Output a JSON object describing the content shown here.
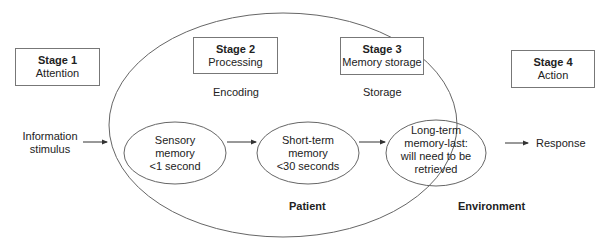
{
  "stages": [
    {
      "title": "Stage 1",
      "subtitle": "Attention"
    },
    {
      "title": "Stage 2",
      "subtitle": "Processing"
    },
    {
      "title": "Stage 3",
      "subtitle": "Memory storage"
    },
    {
      "title": "Stage 4",
      "subtitle": "Action"
    }
  ],
  "phase_labels": {
    "encoding": "Encoding",
    "storage": "Storage"
  },
  "input": {
    "line1": "Information",
    "line2": "stimulus"
  },
  "output": {
    "label": "Response"
  },
  "memory_nodes": [
    {
      "lines": [
        "Sensory",
        "memory",
        "<1 second"
      ]
    },
    {
      "lines": [
        "Short-term",
        "memory",
        "<30 seconds"
      ]
    },
    {
      "lines": [
        "Long-term",
        "memory-last:",
        "will need to be",
        "retrieved"
      ]
    }
  ],
  "context_labels": {
    "patient": "Patient",
    "environment": "Environment"
  },
  "colors": {
    "line": "#555555",
    "text": "#222222"
  }
}
